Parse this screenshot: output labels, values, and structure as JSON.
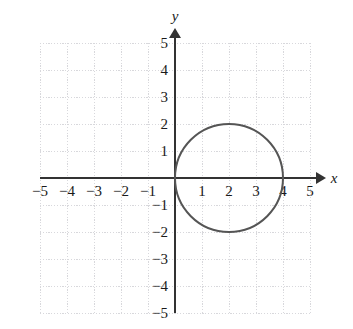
{
  "figure": {
    "title": "",
    "background_color": "#ffffff",
    "width": 353,
    "height": 329
  },
  "axes": {
    "x_label": "x",
    "y_label": "y",
    "axis_color": "#333333",
    "grid_color": "#d8d8dc",
    "grid_style": "dotted",
    "grid_visible": true,
    "origin_px": {
      "x": 175,
      "y": 178
    },
    "unit_px": 27,
    "x_ticks": [
      -5,
      -4,
      -3,
      -2,
      -1,
      1,
      2,
      3,
      4,
      5
    ],
    "y_ticks": [
      5,
      4,
      3,
      2,
      1,
      -1,
      -2,
      -3,
      -4,
      -5
    ],
    "x_tick_labels": [
      "−5",
      "−4",
      "−3",
      "−2",
      "−1",
      "1",
      "2",
      "3",
      "4",
      "5"
    ],
    "y_tick_labels": [
      "5",
      "4",
      "3",
      "2",
      "1",
      "−1",
      "−2",
      "−3",
      "−4",
      "−5"
    ],
    "x_arrow": true,
    "y_arrow": true
  },
  "chart_data": {
    "type": "scatter",
    "title": "",
    "xlabel": "x",
    "ylabel": "y",
    "xlim": [
      -5,
      5
    ],
    "ylim": [
      -5,
      5
    ],
    "grid": true,
    "legend": null,
    "series": [
      {
        "name": "circle",
        "shape": "circle",
        "center": [
          2,
          0
        ],
        "radius": 2,
        "equation": "(x − 2)² + y² = 4",
        "stroke_color": "#555555",
        "stroke_width": 2,
        "fill": "none",
        "key_points": [
          {
            "x": 0,
            "y": 0,
            "note": "leftmost, tangent at origin"
          },
          {
            "x": 4,
            "y": 0,
            "note": "rightmost, x-intercept"
          },
          {
            "x": 2,
            "y": 2,
            "note": "top"
          },
          {
            "x": 2,
            "y": -2,
            "note": "bottom"
          }
        ]
      }
    ]
  }
}
